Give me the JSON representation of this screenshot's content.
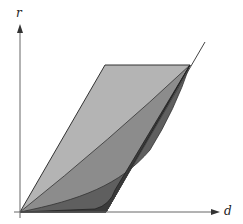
{
  "diagram": {
    "type": "region-plot",
    "axes": {
      "x_label": "d",
      "y_label": "r"
    },
    "regions": [
      {
        "name": "outer-parallelogram",
        "shade": "light",
        "color": "#b4b4b4"
      },
      {
        "name": "region-2",
        "shade": "medium",
        "color": "#8c8c8c"
      },
      {
        "name": "region-3",
        "shade": "dark",
        "color": "#5f5f5f"
      },
      {
        "name": "region-4",
        "shade": "darkest",
        "color": "#3a3a3a"
      }
    ],
    "colors": {
      "axis": "#555555",
      "outline": "#333333",
      "background": "#ffffff"
    }
  }
}
